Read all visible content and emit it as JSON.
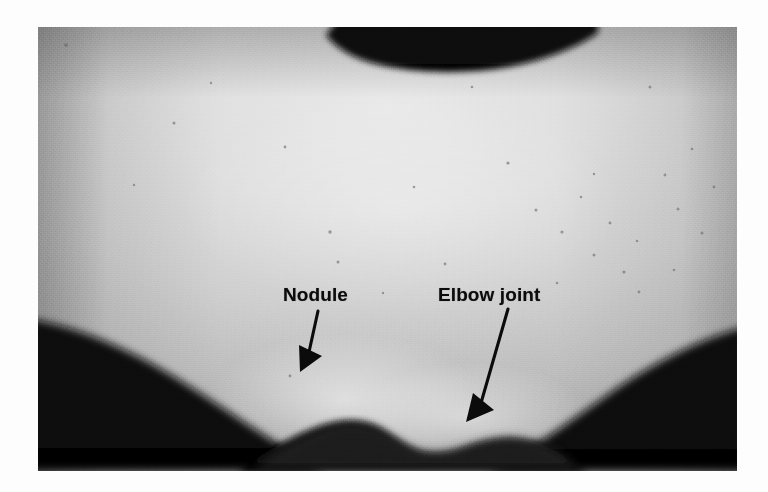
{
  "image": {
    "kind": "clinical-photograph",
    "subject": "posterior elbow with subcutaneous nodule",
    "color_mode": "black-and-white",
    "plate": {
      "left": 38,
      "top": 27,
      "width": 699,
      "height": 444
    },
    "page_background": "#ffffff",
    "tones": {
      "background_dark": "#080808",
      "skin_mid": "#cfcfcf",
      "skin_highlight": "#ededed",
      "skin_shadow": "#8e8e8e",
      "annotation_ink": "#0b0b0b"
    }
  },
  "annotations": [
    {
      "id": "nodule",
      "label": "Nodule",
      "label_x": 283,
      "label_y": 285,
      "arrow": {
        "x1": 310,
        "y1": 310,
        "x2": 307,
        "y2": 370
      },
      "points_to": "rounded subcutaneous mass on the lower contour"
    },
    {
      "id": "elbow-joint",
      "label": "Elbow joint",
      "label_x": 438,
      "label_y": 285,
      "arrow": {
        "x1": 503,
        "y1": 308,
        "x2": 470,
        "y2": 421
      },
      "points_to": "notch of the elbow joint line"
    }
  ]
}
